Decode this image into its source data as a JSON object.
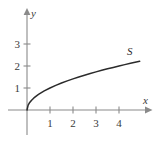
{
  "figure": {
    "background_color": "#ffffff",
    "axis_color": "#8a8a8a",
    "curve_color": "#2b2b2b",
    "text_color": "#3a3a3a"
  },
  "axes": {
    "x_axis_label": "x",
    "y_axis_label": "y",
    "x_ticks": [
      "1",
      "2",
      "3",
      "4"
    ],
    "y_ticks": [
      "1",
      "2",
      "3"
    ]
  },
  "curve": {
    "label": "S"
  },
  "chart_data": {
    "type": "line",
    "title": "",
    "xlabel": "x",
    "ylabel": "y",
    "xlim": [
      -0.85,
      5.25
    ],
    "ylim": [
      -1.15,
      4.45
    ],
    "grid": false,
    "legend": "none",
    "xticks": [
      1,
      2,
      3,
      4
    ],
    "xticklabels": [
      "1",
      "2",
      "3",
      "4"
    ],
    "yticks": [
      1,
      2,
      3
    ],
    "yticklabels": [
      "1",
      "2",
      "3"
    ],
    "annotations": [
      {
        "text": "S",
        "x": 4.45,
        "y": 2.52
      },
      {
        "text": "x",
        "x": 5.1,
        "y": 0.42
      },
      {
        "text": "y",
        "x": 0.33,
        "y": 4.25
      }
    ],
    "series": [
      {
        "name": "S",
        "equation": "y = sqrt(x)",
        "x": [
          0,
          0.05,
          0.1,
          0.2,
          0.3,
          0.4,
          0.5,
          0.75,
          1,
          1.25,
          1.5,
          1.75,
          2,
          2.25,
          2.5,
          2.75,
          3,
          3.25,
          3.5,
          3.75,
          4,
          4.25,
          4.5,
          4.75,
          4.9
        ],
        "values": [
          0,
          0.224,
          0.316,
          0.447,
          0.548,
          0.632,
          0.707,
          0.866,
          1,
          1.118,
          1.225,
          1.323,
          1.414,
          1.5,
          1.581,
          1.658,
          1.732,
          1.803,
          1.871,
          1.936,
          2,
          2.062,
          2.121,
          2.179,
          2.214
        ]
      }
    ]
  }
}
